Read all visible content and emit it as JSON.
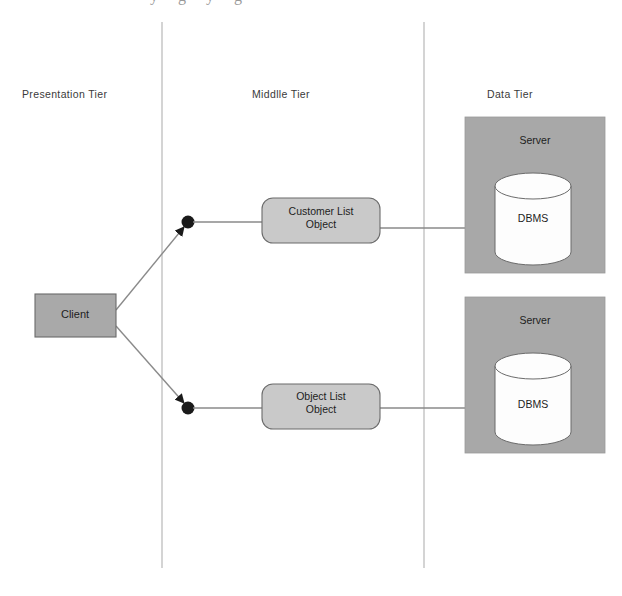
{
  "canvas": {
    "width": 622,
    "height": 596,
    "background": "#ffffff",
    "cropped_title_remnant": "y    g  y    g"
  },
  "colors": {
    "server_fill": "#a8a8a8",
    "client_fill": "#a9a9a9",
    "object_fill": "#c9c9c9",
    "cylinder_fill": "#fdfdfd",
    "stroke": "#6b6b6b",
    "divider": "#bdbdbd",
    "connector": "#8a8a8a",
    "text_dark": "#1d1d1d",
    "text_label": "#3a3a3a"
  },
  "tiers": [
    {
      "id": "presentation",
      "label": "Presentation Tier"
    },
    {
      "id": "middle",
      "label": "Middlle Tier"
    },
    {
      "id": "data",
      "label": "Data Tier"
    }
  ],
  "nodes": {
    "client": {
      "label": "Client"
    },
    "customer_list": {
      "label": "Customer List\nObject"
    },
    "object_list": {
      "label": "Object List\nObject"
    },
    "server_top": {
      "label": "Server"
    },
    "server_bottom": {
      "label": "Server"
    },
    "dbms_top": {
      "label": "DBMS"
    },
    "dbms_bottom": {
      "label": "DBMS"
    }
  },
  "dividers": [
    {
      "id": "presentation-middle",
      "x": 162
    },
    {
      "id": "middle-data",
      "x": 424
    }
  ],
  "connectors": [
    {
      "id": "client-to-upper-junction",
      "from": "client",
      "to": "upper-junction"
    },
    {
      "id": "client-to-lower-junction",
      "from": "client",
      "to": "lower-junction"
    },
    {
      "id": "upper-junction-to-customer-list",
      "from": "upper-junction",
      "to": "customer_list"
    },
    {
      "id": "lower-junction-to-object-list",
      "from": "lower-junction",
      "to": "object_list"
    },
    {
      "id": "customer-list-to-server-top",
      "from": "customer_list",
      "to": "dbms_top"
    },
    {
      "id": "object-list-to-server-bottom",
      "from": "object_list",
      "to": "dbms_bottom"
    }
  ]
}
